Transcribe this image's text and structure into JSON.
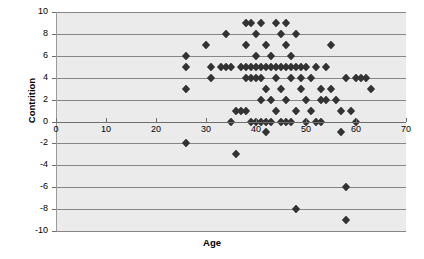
{
  "chart_data": {
    "type": "scatter",
    "title": "",
    "xlabel": "Age",
    "ylabel": "Contrition",
    "xlim": [
      0,
      70
    ],
    "ylim": [
      -10,
      10
    ],
    "xticks": [
      0,
      10,
      20,
      30,
      40,
      50,
      60,
      70
    ],
    "yticks": [
      10,
      8,
      6,
      4,
      2,
      0,
      -2,
      -4,
      -6,
      -8,
      -10
    ],
    "grid": true,
    "legend": "none",
    "marker": "diamond",
    "marker_color": "#333333",
    "plot_background": "#ebebeb",
    "gridline_color": "#868686",
    "points": [
      {
        "x": 26,
        "y": 6
      },
      {
        "x": 26,
        "y": 5
      },
      {
        "x": 26,
        "y": 3
      },
      {
        "x": 26,
        "y": -2
      },
      {
        "x": 30,
        "y": 7
      },
      {
        "x": 31,
        "y": 5
      },
      {
        "x": 31,
        "y": 4
      },
      {
        "x": 33,
        "y": 5
      },
      {
        "x": 34,
        "y": 8
      },
      {
        "x": 34,
        "y": 5
      },
      {
        "x": 35,
        "y": 5
      },
      {
        "x": 35,
        "y": 0
      },
      {
        "x": 36,
        "y": 1
      },
      {
        "x": 36,
        "y": -3
      },
      {
        "x": 37,
        "y": 5
      },
      {
        "x": 37,
        "y": 1
      },
      {
        "x": 38,
        "y": 9
      },
      {
        "x": 38,
        "y": 7
      },
      {
        "x": 38,
        "y": 5
      },
      {
        "x": 38,
        "y": 4
      },
      {
        "x": 38,
        "y": 1
      },
      {
        "x": 39,
        "y": 9
      },
      {
        "x": 39,
        "y": 5
      },
      {
        "x": 39,
        "y": 4
      },
      {
        "x": 39,
        "y": 0
      },
      {
        "x": 40,
        "y": 8
      },
      {
        "x": 40,
        "y": 6
      },
      {
        "x": 40,
        "y": 5
      },
      {
        "x": 40,
        "y": 4
      },
      {
        "x": 40,
        "y": 0
      },
      {
        "x": 41,
        "y": 9
      },
      {
        "x": 41,
        "y": 5
      },
      {
        "x": 41,
        "y": 4
      },
      {
        "x": 41,
        "y": 2
      },
      {
        "x": 41,
        "y": 0
      },
      {
        "x": 42,
        "y": 7
      },
      {
        "x": 42,
        "y": 5
      },
      {
        "x": 42,
        "y": 3
      },
      {
        "x": 42,
        "y": 0
      },
      {
        "x": 42,
        "y": -1
      },
      {
        "x": 43,
        "y": 6
      },
      {
        "x": 43,
        "y": 5
      },
      {
        "x": 43,
        "y": 2
      },
      {
        "x": 43,
        "y": 0
      },
      {
        "x": 44,
        "y": 9
      },
      {
        "x": 44,
        "y": 5
      },
      {
        "x": 44,
        "y": 4
      },
      {
        "x": 44,
        "y": 1
      },
      {
        "x": 45,
        "y": 8
      },
      {
        "x": 45,
        "y": 5
      },
      {
        "x": 45,
        "y": 3
      },
      {
        "x": 45,
        "y": 0
      },
      {
        "x": 46,
        "y": 9
      },
      {
        "x": 46,
        "y": 7
      },
      {
        "x": 46,
        "y": 5
      },
      {
        "x": 46,
        "y": 2
      },
      {
        "x": 46,
        "y": 0
      },
      {
        "x": 47,
        "y": 6
      },
      {
        "x": 47,
        "y": 5
      },
      {
        "x": 47,
        "y": 4
      },
      {
        "x": 47,
        "y": 0
      },
      {
        "x": 48,
        "y": 8
      },
      {
        "x": 48,
        "y": 5
      },
      {
        "x": 48,
        "y": 1
      },
      {
        "x": 48,
        "y": -8
      },
      {
        "x": 49,
        "y": 5
      },
      {
        "x": 49,
        "y": 4
      },
      {
        "x": 49,
        "y": 3
      },
      {
        "x": 50,
        "y": 5
      },
      {
        "x": 50,
        "y": 2
      },
      {
        "x": 50,
        "y": 0
      },
      {
        "x": 51,
        "y": 4
      },
      {
        "x": 51,
        "y": 1
      },
      {
        "x": 52,
        "y": 5
      },
      {
        "x": 52,
        "y": 0
      },
      {
        "x": 53,
        "y": 3
      },
      {
        "x": 53,
        "y": 2
      },
      {
        "x": 53,
        "y": 0
      },
      {
        "x": 54,
        "y": 5
      },
      {
        "x": 54,
        "y": 2
      },
      {
        "x": 55,
        "y": 7
      },
      {
        "x": 55,
        "y": 3
      },
      {
        "x": 56,
        "y": 2
      },
      {
        "x": 57,
        "y": 1
      },
      {
        "x": 57,
        "y": -1
      },
      {
        "x": 58,
        "y": 4
      },
      {
        "x": 58,
        "y": -6
      },
      {
        "x": 58,
        "y": -9
      },
      {
        "x": 59,
        "y": 1
      },
      {
        "x": 60,
        "y": 4
      },
      {
        "x": 60,
        "y": 0
      },
      {
        "x": 61,
        "y": 4
      },
      {
        "x": 62,
        "y": 4
      },
      {
        "x": 63,
        "y": 3
      }
    ]
  }
}
